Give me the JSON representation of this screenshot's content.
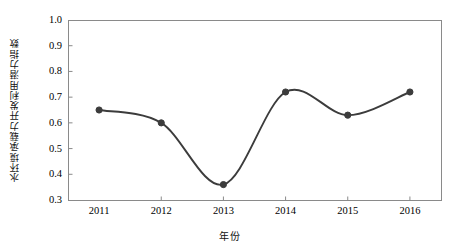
{
  "chart_data": {
    "type": "line",
    "title": "",
    "xlabel": "年份",
    "ylabel": "水环境承载力开发利用潜力指数",
    "categories": [
      "2011",
      "2012",
      "2013",
      "2014",
      "2015",
      "2016"
    ],
    "x": [
      2011,
      2012,
      2013,
      2014,
      2015,
      2016
    ],
    "values": [
      0.65,
      0.6,
      0.36,
      0.72,
      0.63,
      0.72
    ],
    "series": [
      {
        "name": "水环境承载力开发利用潜力指数",
        "values": [
          0.65,
          0.6,
          0.36,
          0.72,
          0.63,
          0.72
        ]
      }
    ],
    "ylim": [
      0.3,
      1.0
    ],
    "yticks": [
      "0.3",
      "0.4",
      "0.5",
      "0.6",
      "0.7",
      "0.8",
      "0.9",
      "1.0"
    ],
    "ytick_values": [
      0.3,
      0.4,
      0.5,
      0.6,
      0.7,
      0.8,
      0.9,
      1.0
    ],
    "xticks": [
      "2011",
      "2012",
      "2013",
      "2014",
      "2015",
      "2016"
    ],
    "grid": false,
    "legend": false,
    "legend_position": "none",
    "line_color": "#3c3c3c",
    "marker_color": "#3c3c3c",
    "marker_shape": "circle",
    "axis_color": "#8a8a8a",
    "background_color": "#ffffff",
    "smoothing": "spline"
  }
}
